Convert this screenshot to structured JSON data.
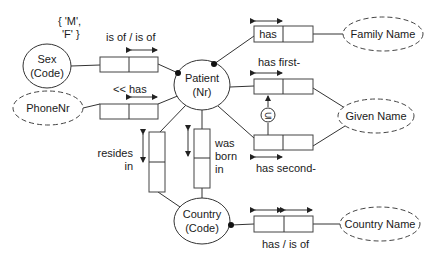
{
  "diagram": {
    "type": "ORM conceptual schema",
    "entity_types": [
      {
        "id": "sex",
        "name": "Sex",
        "ref": "(Code)"
      },
      {
        "id": "patient",
        "name": "Patient",
        "ref": "(Nr)"
      },
      {
        "id": "country",
        "name": "Country",
        "ref": "(Code)"
      }
    ],
    "value_types": [
      {
        "id": "phonenr",
        "name": "PhoneNr"
      },
      {
        "id": "familyname",
        "name": "Family Name"
      },
      {
        "id": "givenname",
        "name": "Given Name"
      },
      {
        "id": "countryname",
        "name": "Country Name"
      }
    ],
    "value_constraint": {
      "line1": "{ 'M',",
      "line2": "'F' }"
    },
    "fact_types": {
      "sex": {
        "reading": "is of / is of"
      },
      "phone": {
        "reading": "<< has"
      },
      "family": {
        "reading": "has"
      },
      "first": {
        "reading": "has first-"
      },
      "second": {
        "reading": "has second-"
      },
      "resides": {
        "line1": "resides",
        "line2": "in"
      },
      "born": {
        "line1": "was",
        "line2": "born",
        "line3": "in"
      },
      "countryname": {
        "reading": "has / is of"
      }
    },
    "subset_constraint": {
      "symbol": "⊆"
    }
  }
}
